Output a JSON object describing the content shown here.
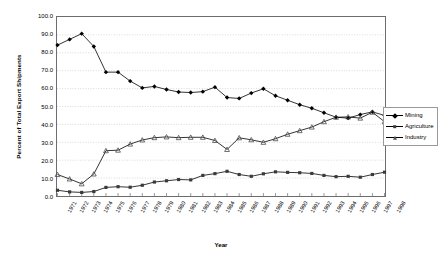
{
  "chart_data": {
    "type": "line",
    "title": "",
    "xlabel": "Year",
    "ylabel": "Percent of Total Export Shipments",
    "ylim": [
      0,
      100
    ],
    "ytick_labels": [
      "0.0",
      "10.0",
      "20.0",
      "30.0",
      "40.0",
      "50.0",
      "60.0",
      "70.0",
      "80.0",
      "90.0",
      "100.0"
    ],
    "ytick_values": [
      0,
      10,
      20,
      30,
      40,
      50,
      60,
      70,
      80,
      90,
      100
    ],
    "grid": true,
    "grid_axis": "y",
    "legend_position": "right",
    "categories": [
      "1971",
      "1972",
      "1973",
      "1974",
      "1975",
      "1976",
      "1977",
      "1978",
      "1979",
      "1980",
      "1981",
      "1982",
      "1983",
      "1984",
      "1985",
      "1986",
      "1987",
      "1988",
      "1989",
      "1990",
      "1991",
      "1992",
      "1993",
      "1994",
      "1995",
      "1996",
      "1997",
      "1998"
    ],
    "series": [
      {
        "name": "Mining",
        "marker": "diamond",
        "values": [
          84.3,
          87.5,
          90.7,
          83.5,
          69.2,
          69.2,
          64.2,
          60.4,
          61.2,
          59.5,
          58.1,
          57.8,
          58.3,
          60.8,
          55.0,
          54.5,
          57.5,
          59.9,
          56.0,
          53.5,
          51.0,
          49.0,
          46.5,
          44.0,
          43.5,
          45.5,
          47.0,
          45.0
        ]
      },
      {
        "name": "Agriculture",
        "marker": "square",
        "values": [
          3.2,
          2.3,
          2.0,
          2.5,
          4.8,
          5.2,
          4.9,
          6.0,
          7.8,
          8.5,
          9.2,
          9.0,
          11.5,
          12.5,
          13.8,
          12.0,
          11.0,
          12.4,
          13.5,
          13.2,
          13.0,
          12.6,
          11.5,
          10.8,
          11.0,
          10.5,
          12.0,
          13.3
        ]
      },
      {
        "name": "Industry",
        "marker": "triangle",
        "values": [
          12.0,
          9.5,
          6.8,
          12.3,
          25.3,
          25.6,
          29.0,
          31.3,
          32.6,
          33.0,
          32.6,
          32.8,
          32.8,
          31.0,
          26.0,
          32.5,
          31.4,
          30.0,
          32.0,
          34.5,
          36.5,
          38.5,
          41.5,
          44.0,
          44.2,
          43.5,
          46.8,
          41.5
        ]
      }
    ]
  },
  "legend": {
    "items": [
      {
        "label": "Mining"
      },
      {
        "label": "Agriculture"
      },
      {
        "label": "Industry"
      }
    ]
  },
  "colors": {
    "line": "#000000",
    "frame": "#6d6d6d",
    "grid": "#c8c8c8",
    "background": "#ffffff"
  }
}
